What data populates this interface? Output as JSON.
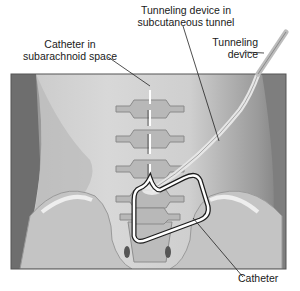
{
  "diagram": {
    "labels": {
      "catheter_subarachnoid": [
        "Catheter in",
        "subarachnoid space"
      ],
      "tunneling_subcutaneous": [
        "Tunneling device in",
        "subcutaneous tunnel"
      ],
      "tunneling_device": [
        "Tunneling",
        "device"
      ],
      "catheter": "Catheter"
    },
    "colors": {
      "frame_border": "#555555",
      "background_light": "#d4d4d4",
      "background_dark": "#8a8a8a",
      "bone": "#bdbdbd",
      "catheter": "#ffffff",
      "leader_line": "#222222"
    }
  }
}
